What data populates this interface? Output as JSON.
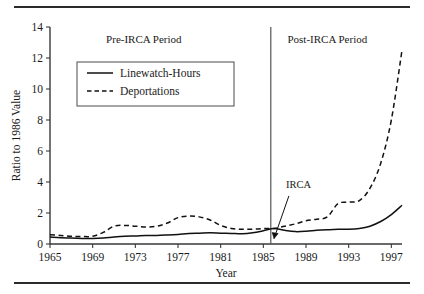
{
  "figure": {
    "rule_top": "horizontal-rule",
    "rule_bottom": "horizontal-rule"
  },
  "chart_data": {
    "type": "line",
    "title": "",
    "xlabel": "Year",
    "ylabel": "Ratio to 1986 Value",
    "xlim": [
      1965,
      1998
    ],
    "ylim": [
      0,
      14
    ],
    "ytick_step": 2,
    "xtick_step": 4,
    "grid": false,
    "legend_position": "upper-left",
    "yticks": [
      "0",
      "2",
      "4",
      "6",
      "8",
      "10",
      "12",
      "14"
    ],
    "xticks": [
      "1965",
      "1969",
      "1973",
      "1977",
      "1981",
      "1985",
      "1989",
      "1993",
      "1997"
    ],
    "x": [
      1965,
      1966,
      1967,
      1968,
      1969,
      1970,
      1971,
      1972,
      1973,
      1974,
      1975,
      1976,
      1977,
      1978,
      1979,
      1980,
      1981,
      1982,
      1983,
      1984,
      1985,
      1986,
      1987,
      1988,
      1989,
      1990,
      1991,
      1992,
      1993,
      1994,
      1995,
      1996,
      1997,
      1998
    ],
    "series": [
      {
        "name": "Linewatch-Hours",
        "style": "solid",
        "values": [
          0.45,
          0.4,
          0.38,
          0.36,
          0.35,
          0.38,
          0.45,
          0.5,
          0.52,
          0.55,
          0.55,
          0.58,
          0.62,
          0.68,
          0.7,
          0.72,
          0.7,
          0.68,
          0.66,
          0.72,
          0.85,
          1.0,
          0.88,
          0.8,
          0.82,
          0.88,
          0.92,
          0.95,
          0.95,
          1.0,
          1.15,
          1.45,
          1.9,
          2.5
        ]
      },
      {
        "name": "Deportations",
        "style": "dashed",
        "values": [
          0.6,
          0.55,
          0.5,
          0.48,
          0.5,
          0.75,
          1.15,
          1.2,
          1.15,
          1.1,
          1.15,
          1.35,
          1.7,
          1.8,
          1.75,
          1.55,
          1.2,
          1.0,
          0.95,
          0.95,
          1.0,
          1.0,
          1.15,
          1.3,
          1.5,
          1.6,
          1.75,
          2.6,
          2.7,
          2.8,
          3.6,
          5.2,
          8.0,
          12.5
        ]
      }
    ],
    "annotations": [
      {
        "name": "pre-irca-period",
        "text": "Pre-IRCA Period",
        "x": 1973.8,
        "y": 13.0
      },
      {
        "name": "post-irca-period",
        "text": "Post-IRCA Period",
        "x": 1991.0,
        "y": 13.0
      },
      {
        "name": "irca-event",
        "text": "IRCA",
        "x": 1988.3,
        "y": 3.6
      }
    ],
    "divider": {
      "name": "irca-divider",
      "x": 1985.7
    }
  }
}
